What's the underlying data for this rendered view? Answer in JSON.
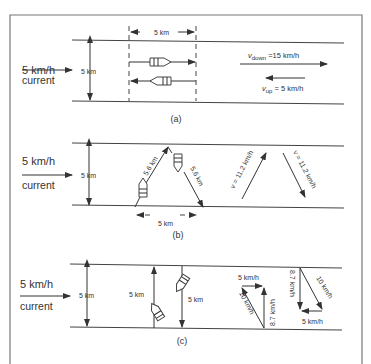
{
  "figure": {
    "panels": [
      {
        "id": "a",
        "caption": "(a)",
        "current_speed": "5 km/h",
        "current_label": "current",
        "river_width": "5 km",
        "span_label": "5 km",
        "v_down": "v",
        "v_down_sub": "down",
        "v_down_value": " =15 km/h",
        "v_up": "v",
        "v_up_sub": "up",
        "v_up_value": " = 5 km/h"
      },
      {
        "id": "b",
        "caption": "(b)",
        "current_speed": "5 km/h",
        "current_label": "current",
        "river_width": "5 km",
        "leg_up": "5.6 km",
        "leg_down": "5.6 km",
        "span_label": "5 km",
        "velocity_up": "v = 11.2 km/h",
        "velocity_down": "v = 11.2 km/h"
      },
      {
        "id": "c",
        "caption": "(c)",
        "current_speed": "5 km/h",
        "current_label": "current",
        "river_width": "5 km",
        "path_up": "5 km",
        "path_down": "5 km",
        "tri1_top": "5 km/h",
        "tri1_hyp": "10 km/h",
        "tri1_vert": "8.7 km/h",
        "tri2_vert": "8.7 km/h",
        "tri2_hyp": "10 km/h",
        "tri2_bottom": "5 km/h"
      }
    ]
  }
}
